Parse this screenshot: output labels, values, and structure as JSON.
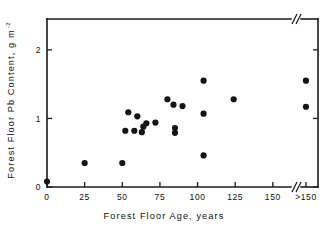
{
  "chart_data": {
    "type": "scatter",
    "title": "",
    "xlabel": "Forest Floor Age, years",
    "ylabel": "Forest Floor Pb Content, g m",
    "ylabel_exponent": "-2",
    "xticks": [
      "0",
      "25",
      "50",
      "75",
      "100",
      "125",
      "150",
      ">150"
    ],
    "xtick_values": [
      0,
      25,
      50,
      75,
      100,
      125,
      150,
      172
    ],
    "yticks": [
      "0",
      "1",
      "2"
    ],
    "ytick_values": [
      0,
      1,
      2
    ],
    "xlim": [
      -6,
      180
    ],
    "ylim": [
      0,
      2.45
    ],
    "grid": false,
    "legend": null,
    "axis_break_x": true,
    "axis_break_note": "axis broken between 150 and >150",
    "points": [
      {
        "x": 0,
        "y": 0.08
      },
      {
        "x": 25,
        "y": 0.35
      },
      {
        "x": 50,
        "y": 0.35
      },
      {
        "x": 52,
        "y": 0.82
      },
      {
        "x": 54,
        "y": 1.09
      },
      {
        "x": 58,
        "y": 0.82
      },
      {
        "x": 60,
        "y": 1.03
      },
      {
        "x": 63,
        "y": 0.8
      },
      {
        "x": 64,
        "y": 0.88
      },
      {
        "x": 66,
        "y": 0.93
      },
      {
        "x": 72,
        "y": 0.94
      },
      {
        "x": 80,
        "y": 1.28
      },
      {
        "x": 84,
        "y": 1.2
      },
      {
        "x": 85,
        "y": 0.86
      },
      {
        "x": 85,
        "y": 0.79
      },
      {
        "x": 90,
        "y": 1.18
      },
      {
        "x": 104,
        "y": 1.55
      },
      {
        "x": 104,
        "y": 1.07
      },
      {
        "x": 104,
        "y": 0.46
      },
      {
        "x": 124,
        "y": 1.28
      },
      {
        "x": 172,
        "y": 1.55
      },
      {
        "x": 172,
        "y": 1.17
      }
    ]
  },
  "figure": {
    "name": "forest-floor-pb-scatter",
    "point_color": "#141414",
    "axis_color": "#1a1a1a",
    "background": "#ffffff"
  }
}
